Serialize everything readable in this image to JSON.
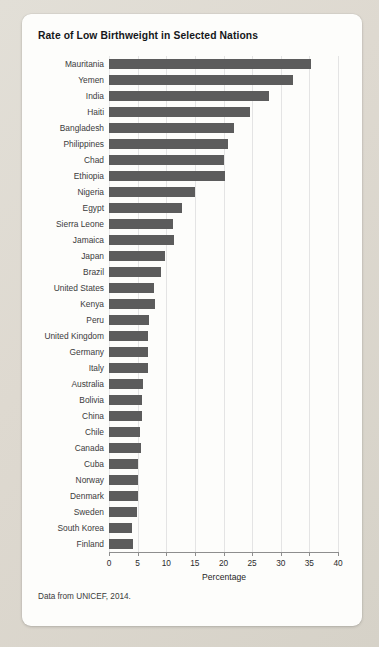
{
  "figure": {
    "title": "Rate of Low Birthweight in Selected Nations",
    "source_note": "Data from UNICEF, 2014.",
    "bar_color": "#5c5c5c",
    "card_background": "#fdfdfb",
    "page_background": "#ded9d0"
  },
  "chart_data": {
    "type": "bar",
    "orientation": "horizontal",
    "title": "Rate of Low Birthweight in Selected Nations",
    "xlabel": "Percentage",
    "ylabel": "",
    "xlim": [
      0,
      40
    ],
    "xticks": [
      0,
      5,
      10,
      15,
      20,
      25,
      30,
      35,
      40
    ],
    "grid": "vertical",
    "legend": "none",
    "annotation": "Data from UNICEF, 2014.",
    "categories": [
      "Mauritania",
      "Yemen",
      "India",
      "Haiti",
      "Bangladesh",
      "Philippines",
      "Chad",
      "Ethiopia",
      "Nigeria",
      "Egypt",
      "Sierra Leone",
      "Jamaica",
      "Japan",
      "Brazil",
      "United States",
      "Kenya",
      "Peru",
      "United Kingdom",
      "Germany",
      "Italy",
      "Australia",
      "Bolivia",
      "China",
      "Chile",
      "Canada",
      "Cuba",
      "Norway",
      "Denmark",
      "Sweden",
      "South Korea",
      "Finland"
    ],
    "values": [
      35.2,
      32.1,
      27.9,
      24.6,
      21.8,
      20.8,
      20.0,
      20.2,
      15.0,
      12.8,
      11.1,
      11.3,
      9.7,
      9.0,
      7.8,
      8.1,
      7.0,
      6.8,
      6.8,
      6.8,
      6.0,
      5.8,
      5.8,
      5.5,
      5.6,
      5.0,
      5.0,
      5.0,
      4.9,
      4.0,
      4.2
    ]
  }
}
